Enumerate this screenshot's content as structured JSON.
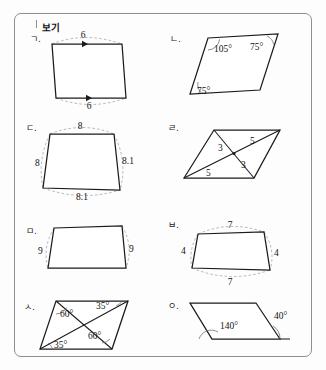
{
  "box": {
    "label": "보기"
  },
  "figures": [
    {
      "id": "a",
      "marker": "ㄱ.",
      "shape": "parallelogram",
      "annotation_type": "side-lengths-with-direction-arrows",
      "labels": [
        {
          "key": "top",
          "text": "6"
        },
        {
          "key": "bottom",
          "text": "6"
        }
      ]
    },
    {
      "id": "b",
      "marker": "ㄴ.",
      "shape": "parallelogram",
      "annotation_type": "angles",
      "labels": [
        {
          "key": "top-left",
          "text": "105°"
        },
        {
          "key": "top-right",
          "text": "75°"
        },
        {
          "key": "bottom-left",
          "text": "75°"
        }
      ]
    },
    {
      "id": "c",
      "marker": "ㄷ.",
      "shape": "quadrilateral",
      "annotation_type": "side-lengths",
      "labels": [
        {
          "key": "top",
          "text": "8"
        },
        {
          "key": "left",
          "text": "8"
        },
        {
          "key": "right",
          "text": "8.1"
        },
        {
          "key": "bottom",
          "text": "8.1"
        }
      ]
    },
    {
      "id": "d",
      "marker": "ㄹ.",
      "shape": "parallelogram-with-diagonals",
      "annotation_type": "diagonal-halves",
      "labels": [
        {
          "key": "upper-left-half",
          "text": "3"
        },
        {
          "key": "upper-right-half",
          "text": "5"
        },
        {
          "key": "lower-right-half",
          "text": "3"
        },
        {
          "key": "lower-left-half",
          "text": "5"
        }
      ]
    },
    {
      "id": "e",
      "marker": "ㅁ.",
      "shape": "parallelogram",
      "annotation_type": "side-lengths",
      "labels": [
        {
          "key": "left",
          "text": "9"
        },
        {
          "key": "right",
          "text": "9"
        }
      ]
    },
    {
      "id": "f",
      "marker": "ㅂ.",
      "shape": "parallelogram",
      "annotation_type": "side-lengths",
      "labels": [
        {
          "key": "top",
          "text": "7"
        },
        {
          "key": "left",
          "text": "4"
        },
        {
          "key": "right",
          "text": "4"
        },
        {
          "key": "bottom",
          "text": "7"
        }
      ]
    },
    {
      "id": "g",
      "marker": "ㅅ.",
      "shape": "parallelogram-with-diagonals",
      "annotation_type": "angles",
      "labels": [
        {
          "key": "top-left",
          "text": "60°"
        },
        {
          "key": "top-right",
          "text": "35°"
        },
        {
          "key": "bottom-right",
          "text": "60°"
        },
        {
          "key": "bottom-left",
          "text": "35°"
        }
      ]
    },
    {
      "id": "h",
      "marker": "ㅇ.",
      "shape": "parallelogram",
      "annotation_type": "angles",
      "labels": [
        {
          "key": "interior",
          "text": "140°"
        },
        {
          "key": "exterior",
          "text": "40°"
        }
      ]
    }
  ]
}
